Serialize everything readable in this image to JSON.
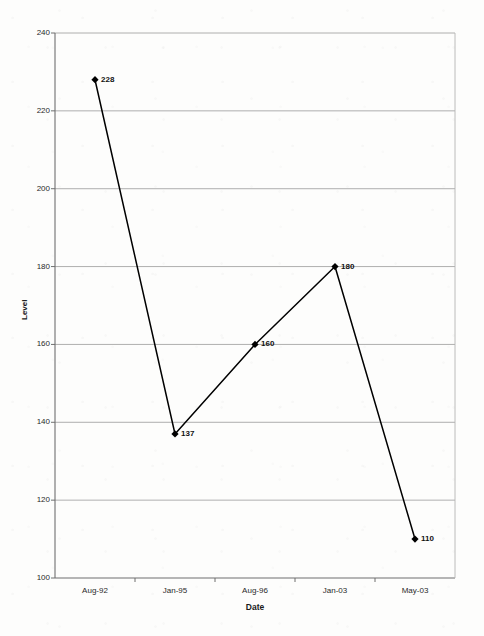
{
  "chart_data": {
    "type": "line",
    "title": "",
    "xlabel": "Date",
    "ylabel": "Level",
    "categories": [
      "Aug-92",
      "Jan-95",
      "Aug-96",
      "Jan-03",
      "May-03"
    ],
    "values": [
      228,
      137,
      160,
      180,
      110
    ],
    "point_labels": [
      "228",
      "137",
      "160",
      "180",
      "110"
    ],
    "ylim": [
      100,
      240
    ],
    "yticks": [
      240,
      220,
      200,
      180,
      160,
      140,
      120,
      100
    ],
    "ytick_labels": [
      "240",
      "220",
      "200",
      "180",
      "160",
      "140",
      "120",
      "100"
    ],
    "grid": "horizontal",
    "legend": "none",
    "series": [
      {
        "name": "Level",
        "values": [
          228,
          137,
          160,
          180,
          110
        ],
        "marker": "diamond",
        "line_color": "#000000",
        "marker_color": "#000000"
      }
    ],
    "colors": {
      "line": "#000000",
      "marker": "#000000",
      "grid": "#9a9a9a",
      "axis": "#6f6f6f",
      "background": "#fdfdfc",
      "text": "#1a1a1a"
    }
  }
}
